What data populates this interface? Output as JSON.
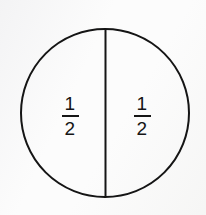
{
  "figure": {
    "shape": "circle",
    "partition": "vertical-diameter",
    "parts_total": 2,
    "background_color": "#fcfcfc",
    "stroke_color": "#151515",
    "stroke_width": 2,
    "circle": {
      "center_x": 105,
      "center_y": 113,
      "radius": 85
    },
    "divider": {
      "orientation": "vertical",
      "x": 105,
      "y_start": 28,
      "y_end": 198
    },
    "labels": [
      {
        "name": "left-half",
        "numerator": "1",
        "denominator": "2",
        "value": "1/2"
      },
      {
        "name": "right-half",
        "numerator": "1",
        "denominator": "2",
        "value": "1/2"
      }
    ]
  }
}
